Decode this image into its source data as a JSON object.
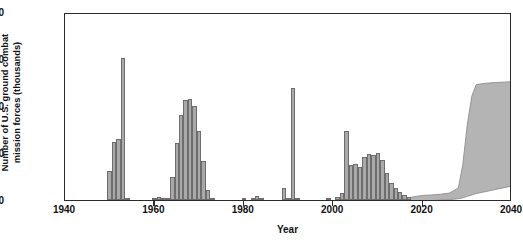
{
  "chart_data": {
    "type": "bar",
    "title": "",
    "xlabel": "Year",
    "ylabel_line1": "Number of U.S. ground combat",
    "ylabel_line2": "mission forces (thousands)",
    "xlim": [
      1940,
      2040
    ],
    "ylim": [
      0,
      800
    ],
    "xticks": [
      1940,
      1960,
      1980,
      2000,
      2020,
      2040
    ],
    "yticks": [
      0,
      200,
      400,
      600,
      800
    ],
    "grid": false,
    "legend": null,
    "bar_color": "#a9a9a9",
    "bar_edge_color": "#6d6d6d",
    "axis_color": "#2b2b2b",
    "projection_fill_color": "#b4b4b4",
    "projection_line_color": "#8f8f8f",
    "x": [
      1950,
      1951,
      1952,
      1953,
      1954,
      1960,
      1961,
      1962,
      1963,
      1964,
      1965,
      1966,
      1967,
      1968,
      1969,
      1970,
      1971,
      1972,
      1973,
      1980,
      1982,
      1983,
      1984,
      1989,
      1990,
      1991,
      1992,
      1999,
      2001,
      2002,
      2003,
      2004,
      2005,
      2006,
      2007,
      2008,
      2009,
      2010,
      2011,
      2012,
      2013,
      2014,
      2015,
      2016,
      2017
    ],
    "values": [
      122,
      248,
      258,
      605,
      8,
      5,
      12,
      9,
      6,
      100,
      243,
      363,
      424,
      430,
      400,
      292,
      168,
      42,
      8,
      4,
      6,
      18,
      8,
      52,
      8,
      478,
      5,
      6,
      12,
      30,
      295,
      148,
      155,
      140,
      185,
      195,
      192,
      198,
      170,
      115,
      72,
      50,
      34,
      22,
      12
    ],
    "projection": {
      "note": "shaded projected force-level band, right portion of axis",
      "x": [
        2015,
        2018,
        2020,
        2022,
        2024,
        2026,
        2028,
        2029,
        2030,
        2031,
        2032,
        2034,
        2036,
        2038,
        2040
      ],
      "upper": [
        12,
        22,
        28,
        30,
        33,
        38,
        60,
        160,
        330,
        450,
        500,
        505,
        508,
        510,
        512
      ],
      "lower": [
        0,
        3,
        5,
        6,
        8,
        10,
        14,
        18,
        24,
        30,
        36,
        44,
        52,
        60,
        68
      ]
    }
  }
}
